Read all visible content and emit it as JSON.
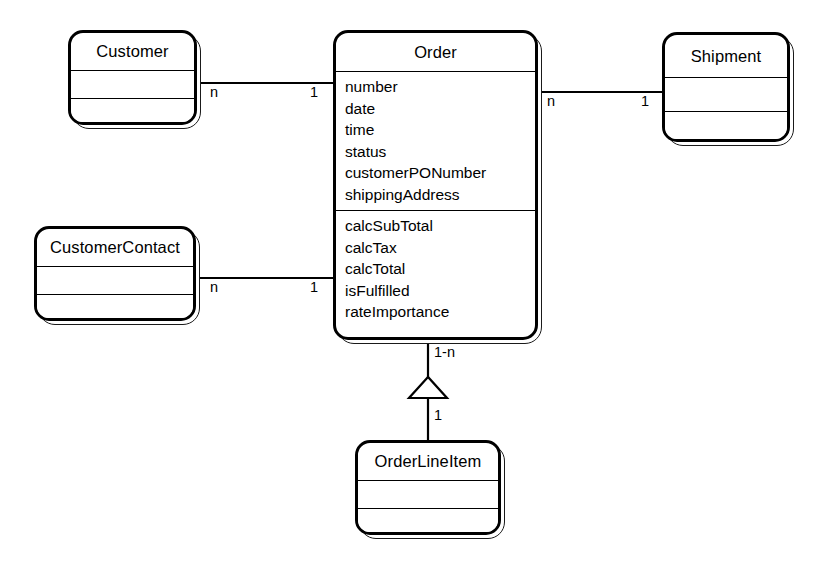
{
  "diagram": {
    "type": "uml-class-diagram",
    "canvas": {
      "width": 818,
      "height": 574
    },
    "stroke_color": "#000000",
    "fill_color": "#ffffff"
  },
  "classes": [
    {
      "id": "customer",
      "name": "Customer",
      "attributes": [],
      "operations": [],
      "compartments": 3,
      "box": {
        "x": 68,
        "y": 30,
        "w": 129,
        "h": 95
      },
      "title_h": 37,
      "attr_h": 28
    },
    {
      "id": "customer_contact",
      "name": "CustomerContact",
      "attributes": [],
      "operations": [],
      "compartments": 3,
      "box": {
        "x": 34,
        "y": 226,
        "w": 162,
        "h": 95
      },
      "title_h": 37,
      "attr_h": 28
    },
    {
      "id": "order",
      "name": "Order",
      "attributes": [
        "number",
        "date",
        "time",
        "status",
        "customerPONumber",
        "shippingAddress"
      ],
      "operations": [
        "calcSubTotal",
        "calcTax",
        "calcTotal",
        "isFulfilled",
        "rateImportance"
      ],
      "compartments": 3,
      "box": {
        "x": 333,
        "y": 30,
        "w": 205,
        "h": 310
      },
      "title_h": 38,
      "attr_h": 140
    },
    {
      "id": "shipment",
      "name": "Shipment",
      "attributes": [],
      "operations": [],
      "compartments": 3,
      "box": {
        "x": 662,
        "y": 32,
        "w": 128,
        "h": 110
      },
      "title_h": 42,
      "attr_h": 34
    },
    {
      "id": "order_line_item",
      "name": "OrderLineItem",
      "attributes": [],
      "operations": [],
      "compartments": 3,
      "box": {
        "x": 355,
        "y": 440,
        "w": 146,
        "h": 95
      },
      "title_h": 37,
      "attr_h": 28
    }
  ],
  "associations": [
    {
      "id": "customer-order",
      "from": "customer",
      "to": "order",
      "kind": "association",
      "from_multiplicity": "n",
      "to_multiplicity": "1",
      "line": {
        "x1": 201,
        "y1": 83,
        "x2": 333,
        "y2": 83
      },
      "from_label_pos": {
        "x": 210,
        "y": 88
      },
      "to_label_pos": {
        "x": 313,
        "y": 88
      }
    },
    {
      "id": "order-shipment",
      "from": "order",
      "to": "shipment",
      "kind": "association",
      "from_multiplicity": "n",
      "to_multiplicity": "1",
      "line": {
        "x1": 542,
        "y1": 92,
        "x2": 666,
        "y2": 92
      },
      "from_label_pos": {
        "x": 548,
        "y": 97
      },
      "to_label_pos": {
        "x": 644,
        "y": 97
      }
    },
    {
      "id": "customercontact-order",
      "from": "customer_contact",
      "to": "order",
      "kind": "association",
      "from_multiplicity": "n",
      "to_multiplicity": "1",
      "line": {
        "x1": 200,
        "y1": 278,
        "x2": 333,
        "y2": 278
      },
      "from_label_pos": {
        "x": 210,
        "y": 283
      },
      "to_label_pos": {
        "x": 313,
        "y": 283
      }
    },
    {
      "id": "order-orderlineitem",
      "from": "order",
      "to": "order_line_item",
      "kind": "generalization-triangle",
      "from_multiplicity": "1-n",
      "to_multiplicity": "1",
      "line_upper": {
        "x1": 428,
        "y1": 344,
        "x2": 428,
        "y2": 378
      },
      "line_lower": {
        "x1": 428,
        "y1": 398,
        "x2": 428,
        "y2": 444
      },
      "triangle": {
        "apex_x": 428,
        "apex_y": 377,
        "left_x": 409,
        "right_x": 447,
        "base_y": 398
      },
      "from_label_pos": {
        "x": 435,
        "y": 357
      },
      "to_label_pos": {
        "x": 435,
        "y": 418
      }
    }
  ]
}
